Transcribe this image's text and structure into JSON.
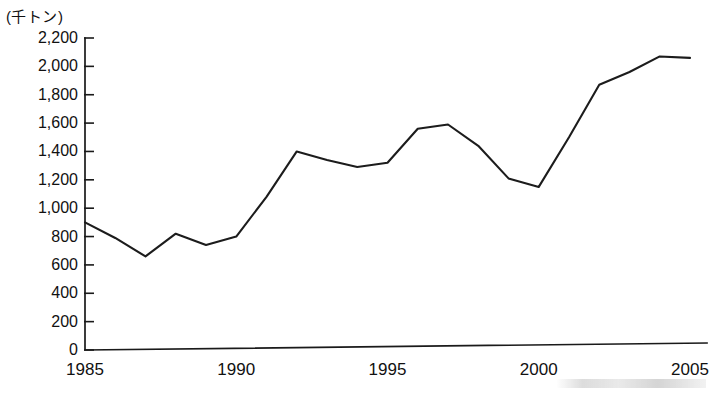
{
  "chart_data": {
    "type": "line",
    "title": "",
    "subtitle": "",
    "xlabel": "",
    "ylabel": "",
    "unit_label": "(千トン)",
    "grid": false,
    "legend": null,
    "xlim": [
      1985,
      2005
    ],
    "ylim": [
      0,
      2200
    ],
    "x_tick_labels": [
      "1985",
      "1990",
      "1995",
      "2000",
      "2005"
    ],
    "x_ticks": [
      1985,
      1990,
      1995,
      2000,
      2005
    ],
    "y_tick_labels": [
      "2,200",
      "2,000",
      "1,800",
      "1,600",
      "1,400",
      "1,200",
      "1,000",
      "800",
      "600",
      "400",
      "200",
      "0"
    ],
    "y_ticks": [
      2200,
      2000,
      1800,
      1600,
      1400,
      1200,
      1000,
      800,
      600,
      400,
      200,
      0
    ],
    "x": [
      1985,
      1986,
      1987,
      1988,
      1989,
      1990,
      1991,
      1992,
      1993,
      1994,
      1995,
      1996,
      1997,
      1998,
      1999,
      2000,
      2001,
      2002,
      2003,
      2004,
      2005
    ],
    "values": [
      900,
      790,
      660,
      820,
      740,
      800,
      1080,
      1400,
      1340,
      1290,
      1320,
      1560,
      1590,
      1440,
      1210,
      1150,
      1500,
      1870,
      1960,
      2070,
      2060
    ],
    "series": [
      {
        "name": "生産量",
        "values": [
          900,
          790,
          660,
          820,
          740,
          800,
          1080,
          1400,
          1340,
          1290,
          1320,
          1560,
          1590,
          1440,
          1210,
          1150,
          1500,
          1870,
          1960,
          2070,
          2060
        ],
        "color": "#1c1c1c"
      }
    ]
  },
  "colors": {
    "line": "#1c1c1c",
    "axis": "#1a1a1a",
    "background": "#ffffff",
    "text": "#111111"
  }
}
